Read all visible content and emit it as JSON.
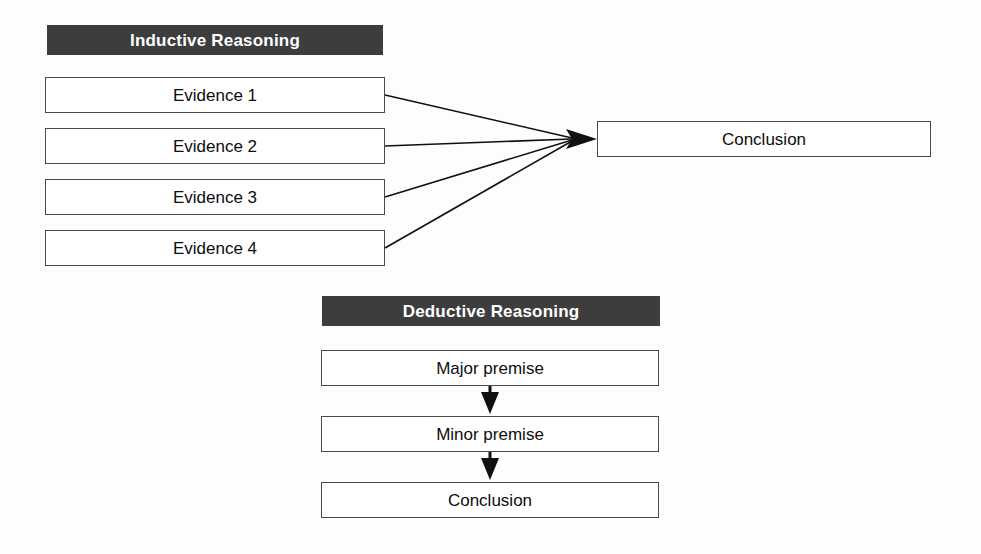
{
  "diagram": {
    "background_color": "#fdfdfc",
    "header_fill": "#3d3d3d",
    "header_text_color": "#ffffff",
    "box_fill": "#ffffff",
    "box_border_color": "#4a4a4a",
    "connector_color": "#101010"
  },
  "inductive": {
    "header": "Inductive Reasoning",
    "premises": [
      {
        "label": "Evidence 1"
      },
      {
        "label": "Evidence 2"
      },
      {
        "label": "Evidence 3"
      },
      {
        "label": "Evidence 4"
      }
    ],
    "conclusion": "Conclusion"
  },
  "deductive": {
    "header": "Deductive Reasoning",
    "steps": [
      {
        "label": "Major premise"
      },
      {
        "label": "Minor premise"
      },
      {
        "label": "Conclusion"
      }
    ]
  }
}
